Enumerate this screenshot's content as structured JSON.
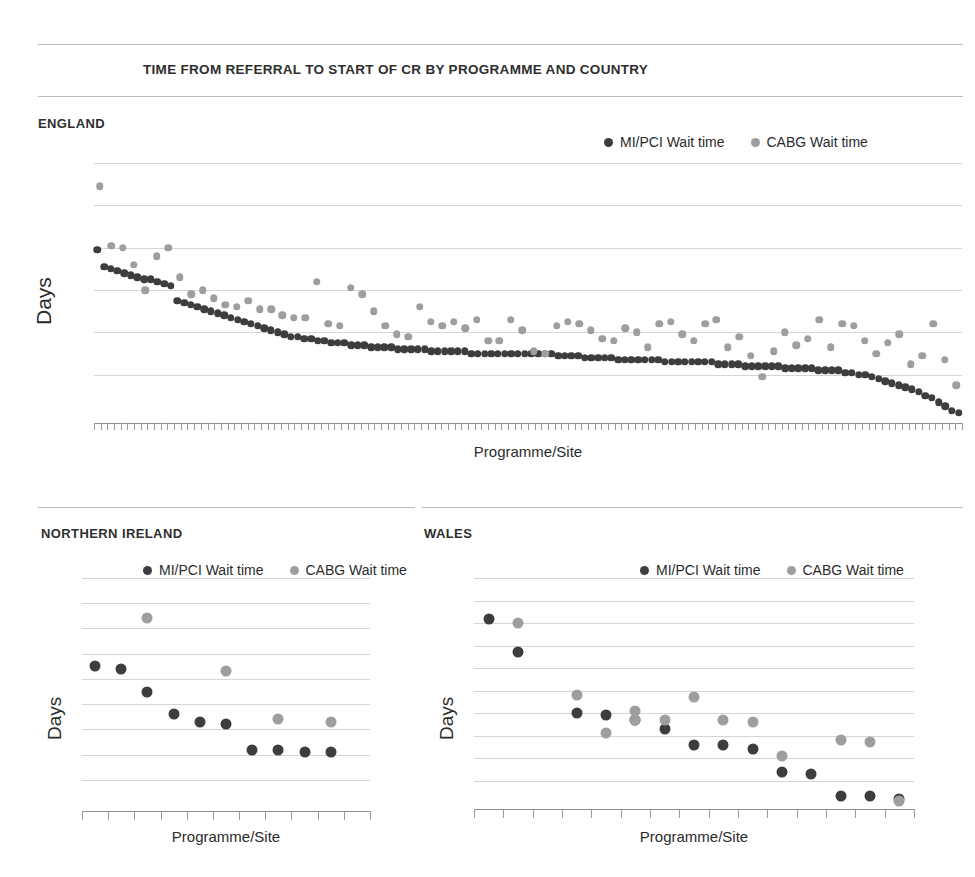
{
  "page": {
    "title": "TIME FROM REFERRAL TO START OF CR BY PROGRAMME AND COUNTRY"
  },
  "legend": {
    "mipci_label": "MI/PCI Wait time",
    "cabg_label": "CABG Wait time",
    "mipci_color": "#3d3d3d",
    "cabg_color": "#9e9e9e"
  },
  "panels": {
    "england": {
      "heading": "ENGLAND"
    },
    "northern_ireland": {
      "heading": "NORTHERN IRELAND"
    },
    "wales": {
      "heading": "WALES"
    }
  },
  "chart_data": [
    {
      "id": "england",
      "type": "scatter",
      "title": "ENGLAND",
      "xlabel": "Programme/Site",
      "ylabel": "Days",
      "ylim": [
        0,
        120
      ],
      "yticks": [
        0,
        20,
        40,
        60,
        80,
        100,
        120
      ],
      "grid": true,
      "legend_position": "top-right",
      "xtick_count": 130,
      "series": [
        {
          "name": "MI/PCI Wait time",
          "color": "#3d3d3d",
          "values": [
            79,
            71,
            70,
            69,
            68,
            67,
            66,
            65,
            65,
            64,
            63,
            62,
            55,
            54,
            53,
            52,
            51,
            50,
            49,
            48,
            47,
            46,
            45,
            44,
            43,
            42,
            41,
            40,
            39,
            38,
            38,
            37,
            37,
            36,
            36,
            35,
            35,
            35,
            34,
            34,
            34,
            33,
            33,
            33,
            33,
            32,
            32,
            32,
            32,
            32,
            31,
            31,
            31,
            31,
            31,
            31,
            30,
            30,
            30,
            30,
            30,
            30,
            30,
            30,
            30,
            30,
            30,
            30,
            30,
            29,
            29,
            29,
            29,
            28,
            28,
            28,
            28,
            28,
            27,
            27,
            27,
            27,
            27,
            27,
            27,
            26,
            26,
            26,
            26,
            26,
            26,
            26,
            26,
            25,
            25,
            25,
            25,
            24,
            24,
            24,
            24,
            24,
            24,
            23,
            23,
            23,
            23,
            23,
            22,
            22,
            22,
            22,
            21,
            21,
            20,
            20,
            19,
            18,
            17,
            16,
            15,
            14,
            13,
            12,
            10,
            9,
            7,
            5,
            3,
            2
          ]
        },
        {
          "name": "CABG Wait time",
          "color": "#9e9e9e",
          "values": [
            109,
            81,
            80,
            72,
            60,
            76,
            80,
            66,
            58,
            60,
            56,
            53,
            52,
            55,
            51,
            51,
            48,
            47,
            47,
            64,
            44,
            43,
            61,
            58,
            50,
            43,
            39,
            38,
            52,
            45,
            43,
            45,
            42,
            46,
            36,
            36,
            46,
            41,
            31,
            30,
            43,
            45,
            44,
            41,
            37,
            36,
            42,
            40,
            33,
            44,
            45,
            39,
            36,
            44,
            46,
            33,
            38,
            29,
            19,
            31,
            40,
            34,
            37,
            46,
            33,
            44,
            43,
            36,
            30,
            35,
            39,
            25,
            29,
            44,
            27,
            15
          ]
        }
      ]
    },
    {
      "id": "northern_ireland",
      "type": "scatter",
      "title": "NORTHERN IRELAND",
      "xlabel": "Programme/Site",
      "ylabel": "Days",
      "ylim": [
        0,
        90
      ],
      "yticks": [
        0,
        10,
        20,
        30,
        40,
        50,
        60,
        70,
        80,
        90
      ],
      "grid": true,
      "legend_position": "top-right",
      "xtick_count": 11,
      "series": [
        {
          "name": "MI/PCI Wait time",
          "color": "#3d3d3d",
          "x": [
            1,
            2,
            3,
            4,
            5,
            6,
            7,
            8,
            9,
            10
          ],
          "values": [
            55,
            54,
            45,
            36,
            33,
            32,
            22,
            22,
            21,
            21
          ]
        },
        {
          "name": "CABG Wait time",
          "color": "#9e9e9e",
          "x": [
            3,
            6,
            8,
            10
          ],
          "values": [
            74,
            53,
            34,
            33
          ]
        }
      ]
    },
    {
      "id": "wales",
      "type": "scatter",
      "title": "WALES",
      "xlabel": "Programme/Site",
      "ylabel": "Days",
      "ylim": [
        0,
        100
      ],
      "yticks": [
        0,
        10,
        20,
        30,
        40,
        50,
        60,
        70,
        80,
        90,
        100
      ],
      "grid": true,
      "legend_position": "top-right",
      "xtick_count": 15,
      "series": [
        {
          "name": "MI/PCI Wait time",
          "color": "#3d3d3d",
          "x": [
            1,
            2,
            4,
            5,
            6,
            7,
            8,
            9,
            10,
            11,
            12,
            13,
            14,
            15
          ],
          "values": [
            82,
            67,
            40,
            39,
            37,
            33,
            26,
            26,
            24,
            14,
            13,
            3,
            3,
            2
          ]
        },
        {
          "name": "CABG Wait time",
          "color": "#9e9e9e",
          "x": [
            2,
            4,
            5,
            6,
            6,
            7,
            8,
            9,
            10,
            11,
            13,
            14,
            15
          ],
          "values": [
            80,
            48,
            31,
            41,
            37,
            37,
            47,
            37,
            36,
            21,
            28,
            27,
            1
          ]
        }
      ]
    }
  ]
}
